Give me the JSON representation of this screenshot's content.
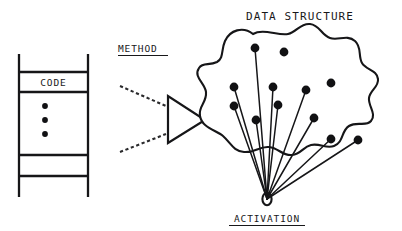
{
  "figure": {
    "background_color": "#ffffff",
    "ink_color": "#161618",
    "arrow_fill_color": "#9a9a9a",
    "width": 402,
    "height": 231
  },
  "labels": {
    "data_structure": "DATA STRUCTURE",
    "method": "METHOD",
    "activation": "ACTIVATION",
    "code": "CODE"
  },
  "code_block": {
    "label": "CODE",
    "vertical_ellipsis_count": 3,
    "rail_left_x": 19,
    "rail_right_x": 88,
    "rail_top_y": 54,
    "rail_bottom_y": 197,
    "rung_y_values": [
      72,
      92,
      155,
      176
    ]
  },
  "method_arrow": {
    "label": "METHOD",
    "underlined": true,
    "triangle_points": "168,96 168,143 205,120",
    "lead_lines": [
      {
        "x1": 120,
        "y1": 86,
        "x2": 166,
        "y2": 106
      },
      {
        "x1": 120,
        "y1": 152,
        "x2": 166,
        "y2": 134
      }
    ]
  },
  "data_structure": {
    "label": "DATA STRUCTURE",
    "activation_label": "ACTIVATION",
    "activation_underlined": true,
    "activation_point": {
      "x": 267,
      "y": 199,
      "rx": 4.6,
      "ry": 6.2
    },
    "node_radius": 4.4,
    "nodes": [
      {
        "id": "n1",
        "x": 255,
        "y": 48
      },
      {
        "id": "n2",
        "x": 284,
        "y": 52
      },
      {
        "id": "n3",
        "x": 234,
        "y": 87
      },
      {
        "id": "n4",
        "x": 273,
        "y": 87
      },
      {
        "id": "n5",
        "x": 331,
        "y": 83
      },
      {
        "id": "n6",
        "x": 306,
        "y": 90
      },
      {
        "id": "n7",
        "x": 234,
        "y": 106
      },
      {
        "id": "n8",
        "x": 278,
        "y": 105
      },
      {
        "id": "n9",
        "x": 256,
        "y": 120
      },
      {
        "id": "n10",
        "x": 314,
        "y": 118
      },
      {
        "id": "n11",
        "x": 331,
        "y": 139
      },
      {
        "id": "n12",
        "x": 358,
        "y": 140
      }
    ],
    "edges_from_activation": [
      "n1",
      "n3",
      "n4",
      "n6",
      "n7",
      "n8",
      "n9",
      "n10",
      "n11",
      "n12"
    ],
    "outline_path": "M 253 34 C 243 26 230 30 225 41 C 221 50 224 58 217 62 C 209 66 203 62 199 68 C 193 77 205 83 206 92 C 207 103 198 106 200 116 C 202 128 216 130 223 136 C 231 143 233 151 244 152 C 255 153 259 146 269 147 C 279 148 282 156 292 155 C 301 154 303 147 311 145 C 320 143 326 149 334 146 C 344 142 341 131 349 126 C 357 121 366 127 371 121 C 377 114 368 106 369 98 C 370 90 379 87 378 79 C 377 70 366 70 362 63 C 358 56 362 47 355 41 C 347 34 338 41 330 38 C 321 35 320 25 310 24 C 300 23 297 32 288 34 C 278 36 263 28 253 34 Z"
  }
}
